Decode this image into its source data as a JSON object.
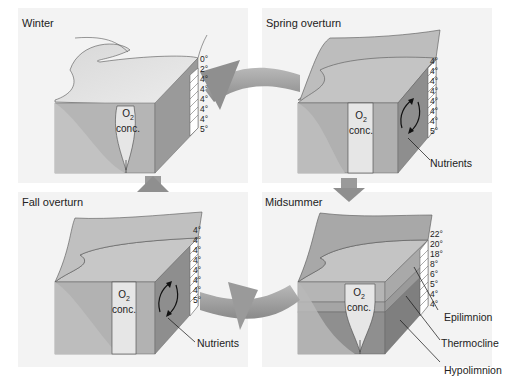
{
  "diagram": {
    "type": "lake seasonal turnover cycle",
    "colors": {
      "panel_bg": "#f3f3f3",
      "water_light": "#b0b0b0",
      "water_mid": "#a0a0a0",
      "water_dark": "#8c8c8c",
      "o2_column": "#e6e6e6",
      "cycle_arrow": "#9a9a9a"
    },
    "panels": [
      {
        "id": "winter",
        "title": "Winter",
        "temperatures": [
          "0°",
          "2°",
          "4°",
          "4°",
          "4°",
          "4°",
          "4°",
          "5°"
        ],
        "o2_label": "O",
        "o2_sub": "2",
        "o2_label2": "conc."
      },
      {
        "id": "spring",
        "title": "Spring overturn",
        "temperatures": [
          "4°",
          "4°",
          "4°",
          "4°",
          "4°",
          "4°",
          "4°",
          "5°"
        ],
        "o2_label": "O",
        "o2_sub": "2",
        "o2_label2": "conc.",
        "callouts": [
          "Nutrients"
        ]
      },
      {
        "id": "fall",
        "title": "Fall overturn",
        "temperatures": [
          "4°",
          "4°",
          "4°",
          "4°",
          "4°",
          "4°",
          "4°",
          "5°"
        ],
        "o2_label": "O",
        "o2_sub": "2",
        "o2_label2": "conc.",
        "callouts": [
          "Nutrients"
        ]
      },
      {
        "id": "midsummer",
        "title": "Midsummer",
        "temperatures": [
          "22°",
          "20°",
          "18°",
          "8°",
          "6°",
          "5°",
          "4°",
          "4°"
        ],
        "o2_label": "O",
        "o2_sub": "2",
        "o2_label2": "conc.",
        "callouts": [
          "Epilimnion",
          "Thermocline",
          "Hypolimnion"
        ]
      }
    ],
    "cycle_order": [
      "Winter",
      "Spring overturn",
      "Midsummer",
      "Fall overturn"
    ]
  }
}
